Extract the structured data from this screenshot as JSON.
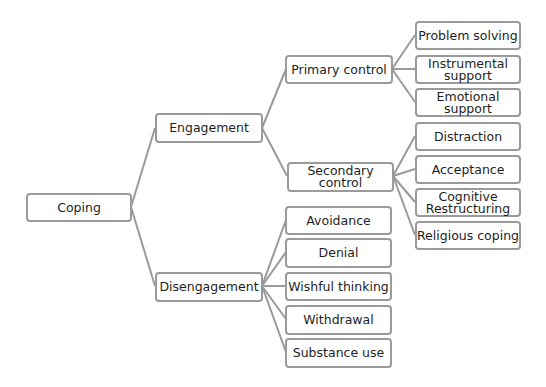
{
  "diagram": {
    "type": "tree",
    "colors": {
      "border": "#9a9a9a",
      "link": "#9a9a9a",
      "text": "#1e1e1e",
      "background": "#ffffff"
    },
    "root": {
      "id": "coping",
      "label": "Coping"
    },
    "level1": [
      {
        "id": "engagement",
        "label": "Engagement"
      },
      {
        "id": "disengagement",
        "label": "Disengagement"
      }
    ],
    "engagement_children": [
      {
        "id": "primary",
        "label": "Primary control"
      },
      {
        "id": "secondary",
        "label": "Secondary control"
      }
    ],
    "primary_children": [
      {
        "label": "Problem solving"
      },
      {
        "label": "Instrumental support"
      },
      {
        "label": "Emotional support"
      }
    ],
    "secondary_children": [
      {
        "label": "Distraction"
      },
      {
        "label": "Acceptance"
      },
      {
        "label": "Cognitive Restructuring"
      },
      {
        "label": "Religious coping"
      }
    ],
    "disengagement_children": [
      {
        "label": "Avoidance"
      },
      {
        "label": "Denial"
      },
      {
        "label": "Wishful thinking"
      },
      {
        "label": "Withdrawal"
      },
      {
        "label": "Substance use"
      }
    ]
  }
}
